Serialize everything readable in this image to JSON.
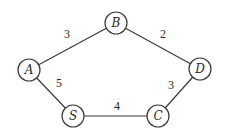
{
  "graph": {
    "nodes": [
      {
        "id": "A",
        "label": "A",
        "x": 29,
        "y": 70
      },
      {
        "id": "B",
        "label": "B",
        "x": 116,
        "y": 23
      },
      {
        "id": "D",
        "label": "D",
        "x": 200,
        "y": 69
      },
      {
        "id": "S",
        "label": "S",
        "x": 73,
        "y": 116
      },
      {
        "id": "C",
        "label": "C",
        "x": 158,
        "y": 116
      }
    ],
    "edges": [
      {
        "from": "A",
        "to": "B",
        "weight": "3",
        "label_x": 67,
        "label_y": 38
      },
      {
        "from": "B",
        "to": "D",
        "weight": "2",
        "label_x": 163,
        "label_y": 38
      },
      {
        "from": "A",
        "to": "S",
        "weight": "5",
        "label_x": 59,
        "label_y": 87
      },
      {
        "from": "D",
        "to": "C",
        "weight": "3",
        "label_x": 171,
        "label_y": 89
      },
      {
        "from": "S",
        "to": "C",
        "weight": "4",
        "label_x": 117,
        "label_y": 110
      }
    ]
  }
}
